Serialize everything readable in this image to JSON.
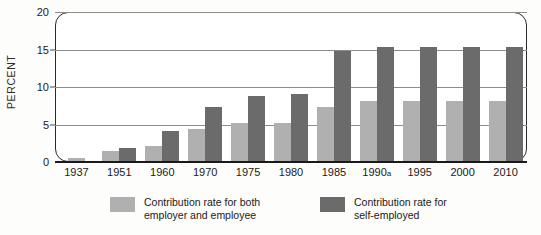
{
  "chart_data": {
    "type": "bar",
    "title": "",
    "xlabel": "",
    "ylabel": "PERCENT",
    "ylim": [
      0,
      20
    ],
    "yticks": [
      0,
      5,
      10,
      15,
      20
    ],
    "grid": true,
    "legend_position": "bottom",
    "categories": [
      "1937",
      "1951",
      "1960",
      "1970",
      "1975",
      "1980",
      "1985",
      "1990a",
      "1995",
      "2000",
      "2010"
    ],
    "series": [
      {
        "name": "Contribution rate for both\nemployer and employee",
        "color": "#b0b0b0",
        "values": [
          0.5,
          1.5,
          2.2,
          4.4,
          5.2,
          5.2,
          7.4,
          8.1,
          8.1,
          8.1,
          8.1
        ]
      },
      {
        "name": "Contribution rate for\nself-employed",
        "color": "#6b6b6b",
        "values": [
          null,
          1.9,
          4.2,
          7.4,
          8.8,
          9.1,
          14.8,
          15.3,
          15.3,
          15.3,
          15.3
        ]
      }
    ],
    "annotations": [
      "a"
    ]
  },
  "axes": {
    "y_title": "PERCENT",
    "y_tick_labels": [
      "20",
      "15",
      "10",
      "5",
      "0"
    ],
    "x_tick_labels": [
      {
        "year": "1937",
        "mark": ""
      },
      {
        "year": "1951",
        "mark": ""
      },
      {
        "year": "1960",
        "mark": ""
      },
      {
        "year": "1970",
        "mark": ""
      },
      {
        "year": "1975",
        "mark": ""
      },
      {
        "year": "1980",
        "mark": ""
      },
      {
        "year": "1985",
        "mark": ""
      },
      {
        "year": "1990",
        "mark": "a"
      },
      {
        "year": "1995",
        "mark": ""
      },
      {
        "year": "2000",
        "mark": ""
      },
      {
        "year": "2010",
        "mark": ""
      }
    ]
  },
  "legend": {
    "items": [
      {
        "label_line1": "Contribution rate for both",
        "label_line2": "employer and employee",
        "color": "#b0b0b0"
      },
      {
        "label_line1": "Contribution rate for",
        "label_line2": "self-employed",
        "color": "#6b6b6b"
      }
    ]
  }
}
